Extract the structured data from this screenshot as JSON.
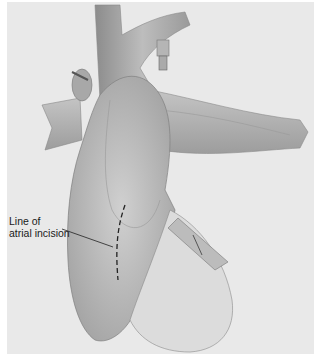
{
  "figure": {
    "type": "surgical-illustration",
    "background_color": "#e9e9e9",
    "annotation": {
      "line1": "Line of",
      "line2": "atrial incision"
    }
  }
}
